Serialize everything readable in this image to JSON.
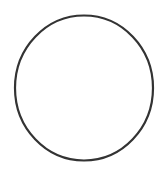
{
  "diagram": {
    "shape": "circle",
    "cx": 84,
    "cy": 88,
    "rx": 69,
    "ry": 72.5,
    "stroke_color": "#333333",
    "stroke_width": 2.2,
    "fill_color": "#ffffff"
  }
}
